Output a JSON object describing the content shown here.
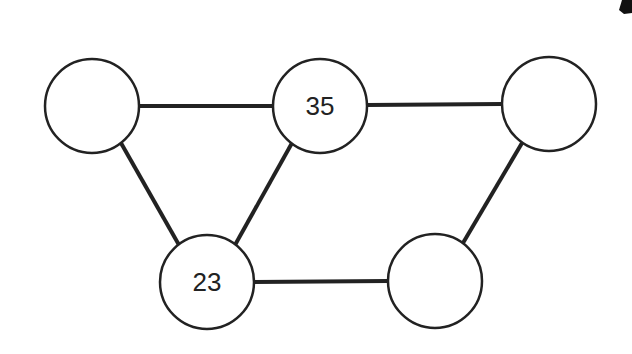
{
  "diagram": {
    "type": "graph",
    "nodes": [
      {
        "id": "n1",
        "label": "",
        "cx": 92,
        "cy": 106,
        "r": 47
      },
      {
        "id": "n2",
        "label": "35",
        "cx": 320,
        "cy": 106,
        "r": 47
      },
      {
        "id": "n3",
        "label": "",
        "cx": 549,
        "cy": 104,
        "r": 47
      },
      {
        "id": "n4",
        "label": "23",
        "cx": 207,
        "cy": 282,
        "r": 47
      },
      {
        "id": "n5",
        "label": "",
        "cx": 435,
        "cy": 281,
        "r": 47
      }
    ],
    "edges": [
      {
        "from": "n1",
        "to": "n2"
      },
      {
        "from": "n2",
        "to": "n3"
      },
      {
        "from": "n1",
        "to": "n4"
      },
      {
        "from": "n2",
        "to": "n4"
      },
      {
        "from": "n4",
        "to": "n5"
      },
      {
        "from": "n3",
        "to": "n5"
      }
    ],
    "colors": {
      "stroke": "#222222",
      "fill": "#ffffff"
    }
  }
}
